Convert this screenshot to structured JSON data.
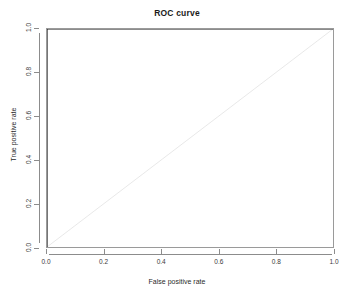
{
  "chart_data": {
    "type": "line",
    "title": "ROC curve",
    "xlabel": "False positive rate",
    "ylabel": "True positive rate",
    "xlim": [
      0,
      1
    ],
    "ylim": [
      0,
      1
    ],
    "grid": false,
    "legend": false,
    "xticks": [
      "0.0",
      "0.2",
      "0.4",
      "0.6",
      "0.8",
      "1.0"
    ],
    "yticks": [
      "0.0",
      "0.2",
      "0.4",
      "0.6",
      "0.8",
      "1.0"
    ],
    "xtick_values": [
      0.0,
      0.2,
      0.4,
      0.6,
      0.8,
      1.0
    ],
    "ytick_values": [
      0.0,
      0.2,
      0.4,
      0.6,
      0.8,
      1.0
    ],
    "series": [
      {
        "name": "ROC curve",
        "color": "#1a1a1a",
        "width": 1.2,
        "style": "solid",
        "x": [
          0.0,
          0.0,
          1.0
        ],
        "y": [
          0.0,
          1.0,
          1.0
        ]
      },
      {
        "name": "chance diagonal",
        "color": "#e2e2e2",
        "width": 0.8,
        "style": "solid",
        "x": [
          0.0,
          1.0
        ],
        "y": [
          0.0,
          1.0
        ]
      }
    ]
  },
  "figure": {
    "background": "#ffffff",
    "box_color": "#9a9a9a",
    "axis_color": "#8c8c8c",
    "tick_label_color": "#3a3a3a"
  }
}
